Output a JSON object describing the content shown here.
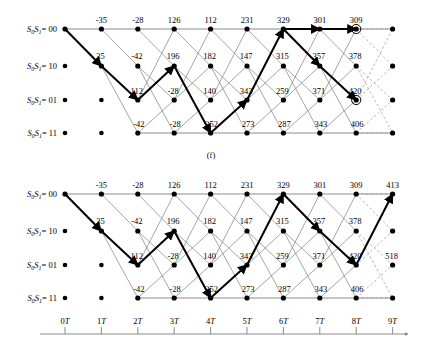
{
  "figure": {
    "caption_top": "(f)",
    "state_labels": [
      {
        "prefix": "S",
        "sub0": "0",
        "mid": "S",
        "sub1": "1",
        "eq": "= 00"
      },
      {
        "prefix": "S",
        "sub0": "0",
        "mid": "S",
        "sub1": "1",
        "eq": "= 10"
      },
      {
        "prefix": "S",
        "sub0": "0",
        "mid": "S",
        "sub1": "1",
        "eq": "= 01"
      },
      {
        "prefix": "S",
        "sub0": "0",
        "mid": "S",
        "sub1": "1",
        "eq": "= 11"
      }
    ],
    "state_label_text": [
      "S0S1= 00",
      "S0S1= 10",
      "S0S1= 01",
      "S0S1= 11"
    ],
    "time_axis": {
      "ticks": [
        "0T",
        "1T",
        "2T",
        "3T",
        "4T",
        "5T",
        "6T",
        "7T",
        "8T",
        "9T"
      ],
      "arrow": true
    },
    "colors": {
      "line": "#808080",
      "bold_path": "#000000",
      "node": "#000000",
      "dashed": "#9a9a9a",
      "text": "#000000"
    }
  },
  "chart_data": {
    "type": "diagram",
    "panels": [
      {
        "id": "top",
        "caption": "(f)",
        "stages": 10,
        "states": 4,
        "metrics": {
          "row0": [
            {
              "stage": 1,
              "value": "-35"
            },
            {
              "stage": 2,
              "value": "-28"
            },
            {
              "stage": 3,
              "value": "126"
            },
            {
              "stage": 4,
              "value": "112"
            },
            {
              "stage": 5,
              "value": "231"
            },
            {
              "stage": 6,
              "value": "329"
            },
            {
              "stage": 7,
              "value": "301"
            },
            {
              "stage": 8,
              "value": "309"
            }
          ],
          "row1": [
            {
              "stage": 1,
              "value": "35"
            },
            {
              "stage": 2,
              "value": "-42"
            },
            {
              "stage": 3,
              "value": "196"
            },
            {
              "stage": 4,
              "value": "182"
            },
            {
              "stage": 5,
              "value": "147"
            },
            {
              "stage": 6,
              "value": "315"
            },
            {
              "stage": 7,
              "value": "357"
            },
            {
              "stage": 8,
              "value": "378"
            }
          ],
          "row2": [
            {
              "stage": 2,
              "value": "112"
            },
            {
              "stage": 3,
              "value": "-28"
            },
            {
              "stage": 4,
              "value": "140"
            },
            {
              "stage": 5,
              "value": "343"
            },
            {
              "stage": 6,
              "value": "259"
            },
            {
              "stage": 7,
              "value": "371"
            },
            {
              "stage": 8,
              "value": "420"
            }
          ],
          "row3": [
            {
              "stage": 2,
              "value": "-42"
            },
            {
              "stage": 3,
              "value": "-28"
            },
            {
              "stage": 4,
              "value": "252"
            },
            {
              "stage": 5,
              "value": "273"
            },
            {
              "stage": 6,
              "value": "287"
            },
            {
              "stage": 7,
              "value": "343"
            },
            {
              "stage": 8,
              "value": "406"
            }
          ]
        },
        "circled_nodes": [
          {
            "stage": 8,
            "state": 0
          },
          {
            "stage": 8,
            "state": 2
          }
        ],
        "survivor_path": [
          {
            "stage": 0,
            "state": 0
          },
          {
            "stage": 1,
            "state": 1
          },
          {
            "stage": 2,
            "state": 2
          },
          {
            "stage": 3,
            "state": 1
          },
          {
            "stage": 4,
            "state": 3
          },
          {
            "stage": 5,
            "state": 2
          },
          {
            "stage": 6,
            "state": 0
          },
          {
            "stage": 7,
            "state": 0
          },
          {
            "stage": 8,
            "state": 0
          }
        ],
        "survivor_branch": [
          {
            "from": {
              "stage": 6,
              "state": 0
            },
            "to": {
              "stage": 7,
              "state": 1
            }
          },
          {
            "from": {
              "stage": 7,
              "state": 1
            },
            "to": {
              "stage": 8,
              "state": 2
            }
          }
        ]
      },
      {
        "id": "bottom",
        "stages": 10,
        "states": 4,
        "metrics": {
          "row0": [
            {
              "stage": 1,
              "value": "-35"
            },
            {
              "stage": 2,
              "value": "-28"
            },
            {
              "stage": 3,
              "value": "126"
            },
            {
              "stage": 4,
              "value": "112"
            },
            {
              "stage": 5,
              "value": "231"
            },
            {
              "stage": 6,
              "value": "329"
            },
            {
              "stage": 7,
              "value": "301"
            },
            {
              "stage": 8,
              "value": "309"
            },
            {
              "stage": 9,
              "value": "413"
            }
          ],
          "row1": [
            {
              "stage": 1,
              "value": "35"
            },
            {
              "stage": 2,
              "value": "-42"
            },
            {
              "stage": 3,
              "value": "196"
            },
            {
              "stage": 4,
              "value": "182"
            },
            {
              "stage": 5,
              "value": "147"
            },
            {
              "stage": 6,
              "value": "315"
            },
            {
              "stage": 7,
              "value": "357"
            },
            {
              "stage": 8,
              "value": "378"
            }
          ],
          "row2": [
            {
              "stage": 2,
              "value": "112"
            },
            {
              "stage": 3,
              "value": "-28"
            },
            {
              "stage": 4,
              "value": "140"
            },
            {
              "stage": 5,
              "value": "343"
            },
            {
              "stage": 6,
              "value": "259"
            },
            {
              "stage": 7,
              "value": "371"
            },
            {
              "stage": 8,
              "value": "420"
            },
            {
              "stage": 9,
              "value": "518"
            }
          ],
          "row3": [
            {
              "stage": 2,
              "value": "-42"
            },
            {
              "stage": 3,
              "value": "-28"
            },
            {
              "stage": 4,
              "value": "252"
            },
            {
              "stage": 5,
              "value": "273"
            },
            {
              "stage": 6,
              "value": "287"
            },
            {
              "stage": 7,
              "value": "343"
            },
            {
              "stage": 8,
              "value": "406"
            }
          ]
        },
        "circled_nodes": [],
        "survivor_path": [
          {
            "stage": 0,
            "state": 0
          },
          {
            "stage": 1,
            "state": 1
          },
          {
            "stage": 2,
            "state": 2
          },
          {
            "stage": 3,
            "state": 1
          },
          {
            "stage": 4,
            "state": 3
          },
          {
            "stage": 5,
            "state": 2
          },
          {
            "stage": 6,
            "state": 0
          },
          {
            "stage": 7,
            "state": 1
          },
          {
            "stage": 8,
            "state": 2
          },
          {
            "stage": 9,
            "state": 0
          }
        ]
      }
    ]
  }
}
